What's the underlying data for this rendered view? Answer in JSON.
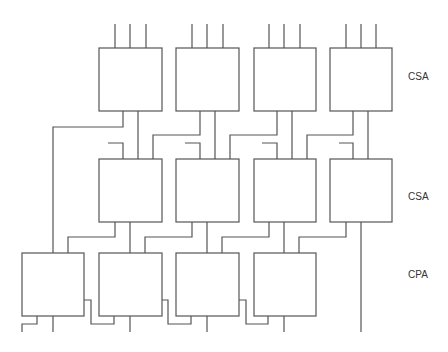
{
  "diagram": {
    "type": "multiplier-reduction-array",
    "rows": [
      {
        "id": "row1",
        "label": "CSA",
        "box_count": 4
      },
      {
        "id": "row2",
        "label": "CSA",
        "box_count": 4
      },
      {
        "id": "row3",
        "label": "CPA",
        "box_count": 4
      }
    ],
    "colors": {
      "line": "#555555",
      "text": "#333333",
      "background": "#ffffff"
    }
  }
}
